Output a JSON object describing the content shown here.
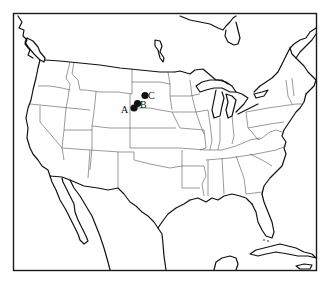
{
  "map": {
    "title": "",
    "region": "United States (contiguous) with southern Canada, northern Mexico and Caribbean",
    "colors": {
      "background": "#ffffff",
      "coastline": "#111111",
      "state_border": "#555555",
      "marker": "#111111"
    },
    "sites": [
      {
        "id": "A",
        "label": "A",
        "x": 134,
        "y": 108,
        "label_x": 121,
        "label_y": 113
      },
      {
        "id": "B",
        "label": "B",
        "x": 137.5,
        "y": 103.5,
        "label_x": 140,
        "label_y": 108
      },
      {
        "id": "C",
        "label": "C",
        "x": 145,
        "y": 95.5,
        "label_x": 148,
        "label_y": 99
      }
    ]
  }
}
